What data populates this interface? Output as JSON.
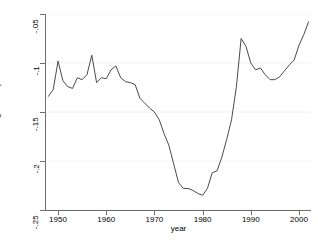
{
  "chart_data": {
    "type": "line",
    "title": "",
    "xlabel": "year",
    "ylabel": "Predicted cointegrated equation",
    "xlim": [
      1947.5,
      2002.5
    ],
    "ylim": [
      -0.25,
      -0.05
    ],
    "grid": true,
    "grid_axis": "y",
    "legend": "none",
    "line_color": "#4a4a4a",
    "xticks": [
      "1950",
      "1960",
      "1970",
      "1980",
      "1990",
      "2000"
    ],
    "xtick_values": [
      1950,
      1960,
      1970,
      1980,
      1990,
      2000
    ],
    "yticks": [
      "-.05",
      "-.1",
      "-.15",
      "-.2",
      "-.25"
    ],
    "ytick_values": [
      -0.05,
      -0.1,
      -0.15,
      -0.2,
      -0.25
    ],
    "series": [
      {
        "name": "Predicted cointegrated equation",
        "x": [
          1948,
          1949,
          1950,
          1951,
          1952,
          1953,
          1954,
          1955,
          1956,
          1957,
          1958,
          1959,
          1960,
          1961,
          1962,
          1963,
          1964,
          1965,
          1966,
          1967,
          1968,
          1969,
          1970,
          1971,
          1972,
          1973,
          1974,
          1975,
          1976,
          1977,
          1978,
          1979,
          1980,
          1981,
          1982,
          1983,
          1984,
          1985,
          1986,
          1987,
          1988,
          1989,
          1990,
          1991,
          1992,
          1993,
          1994,
          1995,
          1996,
          1997,
          1998,
          1999,
          2000,
          2001,
          2002
        ],
        "values": [
          -0.134,
          -0.127,
          -0.098,
          -0.118,
          -0.124,
          -0.126,
          -0.115,
          -0.117,
          -0.112,
          -0.092,
          -0.12,
          -0.115,
          -0.116,
          -0.107,
          -0.103,
          -0.115,
          -0.119,
          -0.12,
          -0.122,
          -0.136,
          -0.141,
          -0.146,
          -0.15,
          -0.158,
          -0.172,
          -0.184,
          -0.203,
          -0.222,
          -0.228,
          -0.228,
          -0.23,
          -0.233,
          -0.235,
          -0.228,
          -0.212,
          -0.21,
          -0.196,
          -0.178,
          -0.158,
          -0.125,
          -0.075,
          -0.083,
          -0.1,
          -0.107,
          -0.105,
          -0.112,
          -0.117,
          -0.117,
          -0.114,
          -0.108,
          -0.102,
          -0.097,
          -0.082,
          -0.071,
          -0.058
        ]
      }
    ]
  },
  "axes": {
    "ylabel_text": "Predicted cointegrated equation",
    "xlabel_text": "year"
  }
}
